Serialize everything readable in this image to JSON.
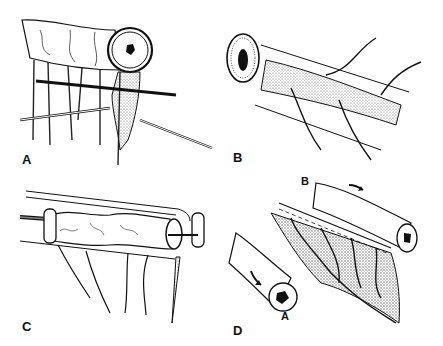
{
  "figure": {
    "type": "surgical-illustration",
    "panels": [
      {
        "id": "A",
        "label": "A",
        "description": "Bowel segment with mesentery; two probes/instruments passed through mesentery, stippled mesenteric tissue below lumen"
      },
      {
        "id": "B",
        "label": "B",
        "description": "Cross-section of bowel with stippled mesenteric strip and vessels branching over it"
      },
      {
        "id": "C",
        "label": "C",
        "description": "Bowel segment threaded on rod with clamp rails; mesenteric vessels hanging below"
      },
      {
        "id": "D",
        "label": "D",
        "sublabels": [
          "B",
          "A"
        ],
        "description": "Two bowel limbs (A and B) with stippled mesenteric sheet between; arrows indicate direction of rotation"
      }
    ]
  },
  "colors": {
    "ink": "#111111",
    "background": "#ffffff",
    "stipple": "#8a8a8a"
  }
}
